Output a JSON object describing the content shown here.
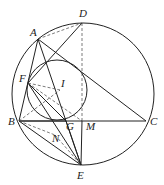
{
  "diagram": {
    "type": "geometry",
    "points": {
      "A": {
        "label": "A",
        "x": 38,
        "y": 39
      },
      "B": {
        "label": "B",
        "x": 19,
        "y": 121
      },
      "C": {
        "label": "C",
        "x": 146,
        "y": 121
      },
      "D": {
        "label": "D",
        "x": 82,
        "y": 23
      },
      "E": {
        "label": "E",
        "x": 81,
        "y": 165
      },
      "F": {
        "label": "F",
        "x": 28,
        "y": 83
      },
      "G": {
        "label": "G",
        "x": 66,
        "y": 121
      },
      "I": {
        "label": "I",
        "x": 60,
        "y": 90
      },
      "M": {
        "label": "M",
        "x": 82,
        "y": 121
      },
      "N": {
        "label": "N",
        "x": 55,
        "y": 135
      }
    },
    "circles": [
      {
        "name": "circumcircle",
        "cx": 83,
        "cy": 94,
        "r": 71
      },
      {
        "name": "small-circle",
        "cx": 57,
        "cy": 90,
        "r": 30
      }
    ],
    "solid_segments": [
      [
        "A",
        "B"
      ],
      [
        "A",
        "C"
      ],
      [
        "B",
        "C"
      ],
      [
        "A",
        "E"
      ],
      [
        "F",
        "E"
      ],
      [
        "F",
        "G"
      ],
      [
        "B",
        "G"
      ],
      [
        "G",
        "E"
      ],
      [
        "M",
        "E"
      ],
      [
        "F",
        "D"
      ],
      [
        "B",
        "E"
      ]
    ],
    "dashed_segments": [
      [
        "A",
        "D"
      ],
      [
        "D",
        "M"
      ],
      [
        "F",
        "M"
      ],
      [
        "F",
        "I"
      ],
      [
        "B",
        "I"
      ],
      [
        "B",
        "N"
      ],
      [
        "N",
        "E"
      ]
    ]
  }
}
